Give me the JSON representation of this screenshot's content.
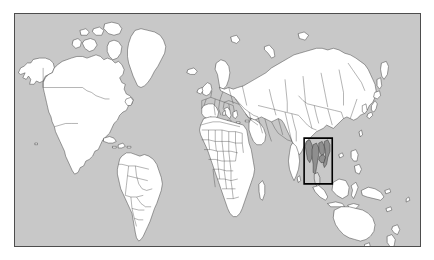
{
  "figure": {
    "type": "world-map",
    "title": "",
    "width_px": 434,
    "height_px": 260,
    "canvas_background": "#ffffff"
  },
  "map": {
    "projection": "equirectangular",
    "ocean_color": "#c8c8c8",
    "land_color": "#ffffff",
    "border_color": "#333333",
    "frame_color": "#4d4d4d",
    "frame": {
      "left": 14,
      "top": 13,
      "width": 407,
      "height": 234
    },
    "lon_range": [
      -180,
      180
    ],
    "lat_range": [
      -58,
      84
    ],
    "graticule": false,
    "labels_visible": false
  },
  "highlight": {
    "name": "region-of-interest-box",
    "shape": "rectangle",
    "stroke_color": "#000000",
    "stroke_width_px": 1.6,
    "fill": "none",
    "region_label": "Mainland Southeast Asia",
    "bounds_px": {
      "x": 326,
      "y": 141,
      "width": 19,
      "height": 23
    },
    "bounds_lonlat": {
      "west": 96,
      "east": 113,
      "north": 29,
      "south": 6
    },
    "countries_shaded": [
      "Myanmar",
      "Thailand",
      "Laos",
      "Vietnam",
      "Cambodia"
    ],
    "shade_color": "#8f8f8f"
  },
  "continents": [
    {
      "name": "North America"
    },
    {
      "name": "South America"
    },
    {
      "name": "Europe"
    },
    {
      "name": "Africa"
    },
    {
      "name": "Asia"
    },
    {
      "name": "Oceania"
    }
  ],
  "chart_data": {
    "type": "map",
    "title": "",
    "xlabel": "",
    "ylabel": "",
    "projection": "equirectangular",
    "xlim": [
      -180,
      180
    ],
    "ylim": [
      -58,
      84
    ],
    "grid": false,
    "legend": "none",
    "annotations": [
      {
        "kind": "rectangle",
        "label": "Mainland Southeast Asia",
        "west": 96,
        "east": 113,
        "north": 29,
        "south": 6,
        "edge_color": "#000000",
        "face_color": "none",
        "line_width": 1.6
      }
    ],
    "series": [
      {
        "name": "landmass",
        "face_color": "#ffffff",
        "edge_color": "#333333",
        "values": []
      },
      {
        "name": "highlighted countries",
        "face_color": "#8f8f8f",
        "edge_color": "#2b2b2b",
        "values": []
      }
    ]
  }
}
